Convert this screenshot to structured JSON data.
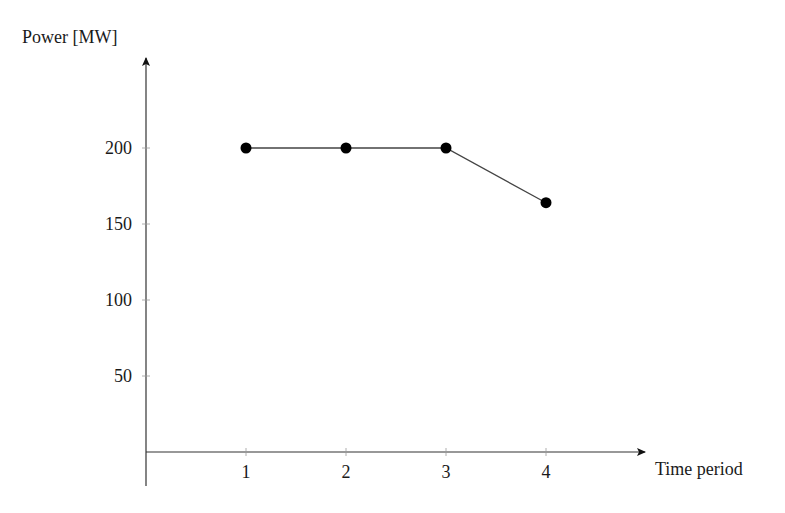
{
  "chart_data": {
    "type": "line",
    "title": "",
    "xlabel": "Time period",
    "ylabel": "Power [MW]",
    "categories": [
      1,
      2,
      3,
      4
    ],
    "x": [
      1,
      2,
      3,
      4
    ],
    "series": [
      {
        "name": "Power",
        "values": [
          200,
          200,
          200,
          164
        ],
        "marker": "circle",
        "color": "#000000"
      }
    ],
    "x_ticks": [
      "1",
      "2",
      "3",
      "4"
    ],
    "y_ticks": [
      "50",
      "100",
      "150",
      "200"
    ],
    "xlim": [
      0,
      5
    ],
    "ylim": [
      0,
      250
    ],
    "grid": false,
    "legend": null
  },
  "colors": {
    "axis": "#333333",
    "line": "#444444",
    "marker": "#000000"
  }
}
